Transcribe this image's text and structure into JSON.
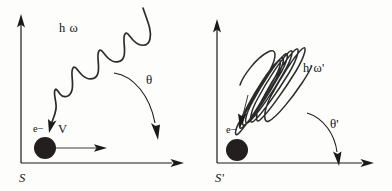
{
  "figure": {
    "title_visible": false,
    "background_color": "#fdfdfc",
    "ink_color": "#1a1a1a",
    "panels": [
      {
        "id": "left",
        "frame_label": "S",
        "photon_label": "h ω",
        "angle_label": "θ",
        "electron_label": "e−",
        "velocity_label": "V",
        "wave_description": "long-wavelength zigzag photon travelling down-left",
        "axes": {
          "x_axis": "horizontal-arrow",
          "y_axis": "vertical-arrow"
        }
      },
      {
        "id": "right",
        "frame_label": "S'",
        "photon_label": "h ω'",
        "angle_label": "θ'",
        "electron_label": "e−",
        "velocity_label": "",
        "wave_description": "short-wavelength compressed photon travelling down-left",
        "axes": {
          "x_axis": "horizontal-arrow",
          "y_axis": "vertical-arrow"
        }
      }
    ]
  },
  "colors": {
    "ink": "#1a1a1a",
    "wave": "#2b2b2b",
    "electron": "#241f1f",
    "background": "#fdfdfc"
  }
}
